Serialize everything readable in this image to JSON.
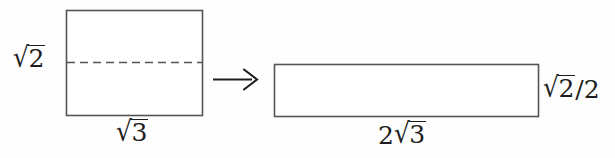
{
  "figure": {
    "kind": "geometry-diagram",
    "background_color": "#fefefe",
    "stroke_color": "#555555",
    "text_color": "#1d1d1d"
  },
  "left_shape": {
    "name": "source-rectangle",
    "x": 66,
    "y": 10,
    "width": 136,
    "height": 105,
    "midline_y": 62,
    "midline_style": "dashed",
    "height_label": {
      "radical": "2",
      "coefficient": "",
      "denominator": "",
      "text": "√2"
    },
    "width_label": {
      "radical": "3",
      "coefficient": "",
      "denominator": "",
      "text": "√3"
    }
  },
  "arrow": {
    "name": "transformation-arrow",
    "x1": 213,
    "y1": 79,
    "x2": 256,
    "y2": 79,
    "direction": "right",
    "glyph": "→"
  },
  "right_shape": {
    "name": "result-rectangle",
    "x": 274,
    "y": 64,
    "width": 265,
    "height": 53,
    "height_label": {
      "radical": "2",
      "coefficient": "",
      "denominator": "2",
      "text": "√2/2"
    },
    "width_label": {
      "radical": "3",
      "coefficient": "2",
      "denominator": "",
      "text": "2√3"
    }
  },
  "labels": {
    "radical_sign": "√",
    "fraction_slash": "/",
    "left_height": "√2",
    "left_width": "√3",
    "right_height": "√2/2",
    "right_width": "2√3"
  }
}
